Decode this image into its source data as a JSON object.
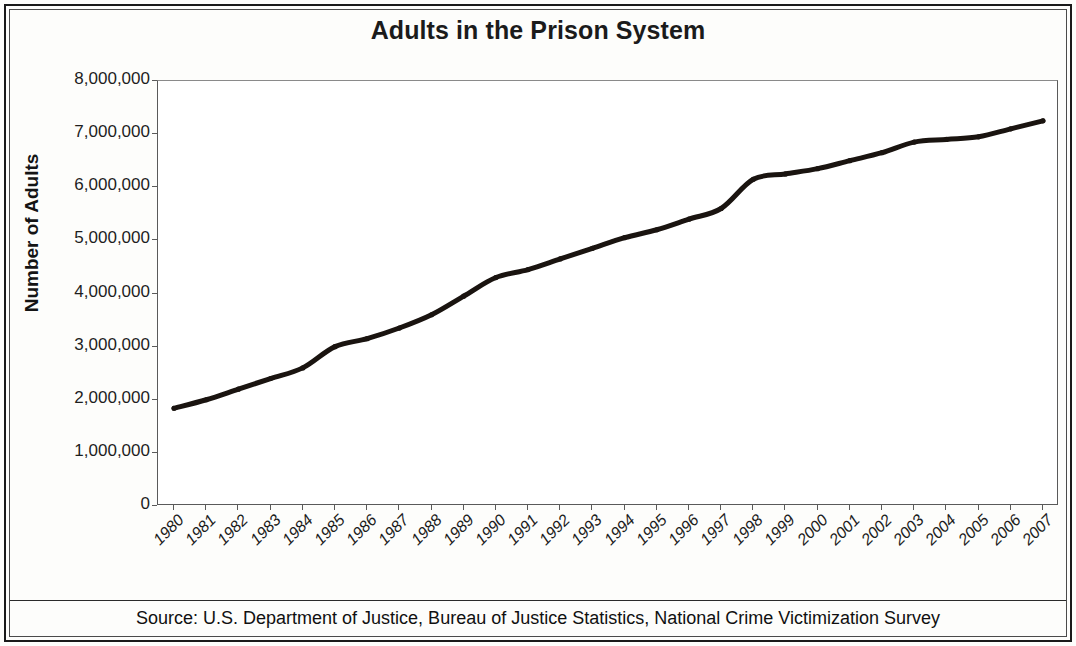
{
  "chart_data": {
    "type": "line",
    "title": "Adults in the Prison System",
    "xlabel": "",
    "ylabel": "Number of Adults",
    "source": "Source: U.S. Department of Justice, Bureau of Justice Statistics, National Crime Victimization Survey",
    "ylim": [
      0,
      8000000
    ],
    "ytick_labels": [
      "8,000,000",
      "7,000,000",
      "6,000,000",
      "5,000,000",
      "4,000,000",
      "3,000,000",
      "2,000,000",
      "1,000,000",
      "0"
    ],
    "ytick_values": [
      8000000,
      7000000,
      6000000,
      5000000,
      4000000,
      3000000,
      2000000,
      1000000,
      0
    ],
    "grid": false,
    "legend": false,
    "line_color": "#1a1410",
    "line_width": 5,
    "categories": [
      "1980",
      "1981",
      "1982",
      "1983",
      "1984",
      "1985",
      "1986",
      "1987",
      "1988",
      "1989",
      "1990",
      "1991",
      "1992",
      "1993",
      "1994",
      "1995",
      "1996",
      "1997",
      "1998",
      "1999",
      "2000",
      "2001",
      "2002",
      "2003",
      "2004",
      "2005",
      "2006",
      "2007"
    ],
    "values": [
      1840000,
      2000000,
      2200000,
      2400000,
      2600000,
      3000000,
      3150000,
      3350000,
      3600000,
      3950000,
      4300000,
      4450000,
      4650000,
      4850000,
      5050000,
      5200000,
      5400000,
      5600000,
      6150000,
      6250000,
      6350000,
      6500000,
      6650000,
      6850000,
      6900000,
      6950000,
      7100000,
      7250000
    ],
    "series_name": "Adults in the prison system"
  }
}
